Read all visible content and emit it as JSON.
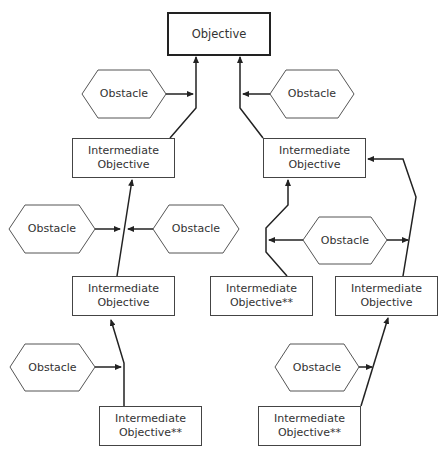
{
  "diagram": {
    "objective": {
      "label": "Objective"
    },
    "intermediate_objectives": [
      {
        "id": "io-l1",
        "line1": "Intermediate",
        "line2": "Objective"
      },
      {
        "id": "io-r1",
        "line1": "Intermediate",
        "line2": "Objective"
      },
      {
        "id": "io-l2",
        "line1": "Intermediate",
        "line2": "Objective"
      },
      {
        "id": "io-m2",
        "line1": "Intermediate",
        "line2": "Objective**"
      },
      {
        "id": "io-r2",
        "line1": "Intermediate",
        "line2": "Objective"
      },
      {
        "id": "io-l3",
        "line1": "Intermediate",
        "line2": "Objective**"
      },
      {
        "id": "io-r3",
        "line1": "Intermediate",
        "line2": "Objective**"
      }
    ],
    "obstacles": [
      {
        "id": "ob-top-left",
        "label": "Obstacle"
      },
      {
        "id": "ob-top-right",
        "label": "Obstacle"
      },
      {
        "id": "ob-mid-left-a",
        "label": "Obstacle"
      },
      {
        "id": "ob-mid-left-b",
        "label": "Obstacle"
      },
      {
        "id": "ob-mid-right",
        "label": "Obstacle"
      },
      {
        "id": "ob-bottom-left",
        "label": "Obstacle"
      },
      {
        "id": "ob-bottom-right",
        "label": "Obstacle"
      }
    ],
    "colors": {
      "line": "#222222",
      "box_border": "#444444",
      "text": "#333333"
    }
  }
}
